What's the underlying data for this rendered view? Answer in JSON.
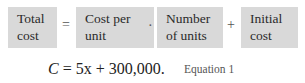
{
  "verbal_model": {
    "terms": [
      {
        "line1": "Total",
        "line2": "cost"
      },
      {
        "line1": "Cost per",
        "line2": "unit"
      },
      {
        "line1": "Number",
        "line2": "of units"
      },
      {
        "line1": "Initial",
        "line2": "cost"
      }
    ],
    "operators": [
      "=",
      "·",
      "+"
    ]
  },
  "equation": {
    "text": "C = 5x + 300,000.",
    "label": "Equation 1"
  },
  "colors": {
    "box_fill": "#d9d9d9",
    "text": "#2a2a2a"
  }
}
